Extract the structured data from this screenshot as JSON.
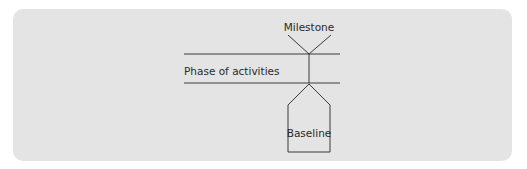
{
  "diagram": {
    "type": "milestone-phase-baseline",
    "labels": {
      "milestone": "Milestone",
      "phase": "Phase of activities",
      "baseline": "Baseline"
    },
    "colors": {
      "panel_background": "#e4e4e4",
      "page_background": "#ffffff",
      "stroke": "#3a3a3a",
      "text": "#2a2a2a"
    },
    "shapes": [
      {
        "id": "milestone-marker",
        "kind": "inverted-triangle",
        "label": "Milestone"
      },
      {
        "id": "phase-band",
        "kind": "two-horizontal-lines",
        "label": "Phase of activities"
      },
      {
        "id": "connector",
        "kind": "vertical-line"
      },
      {
        "id": "baseline-marker",
        "kind": "pentagon-arrow-up",
        "label": "Baseline"
      }
    ]
  }
}
